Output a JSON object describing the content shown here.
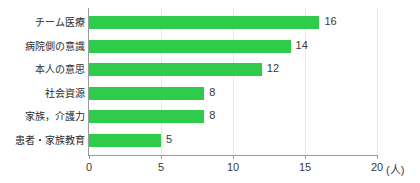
{
  "chart_data": {
    "type": "bar",
    "orientation": "horizontal",
    "title": "",
    "xlabel": "(人)",
    "ylabel": "",
    "xlim": [
      0,
      20
    ],
    "xticks": [
      0,
      5,
      10,
      15,
      20
    ],
    "xtick_labels": [
      "0",
      "5",
      "10",
      "15",
      "20"
    ],
    "grid": true,
    "grid_axis": "x",
    "legend": false,
    "bar_color": "#2ecc4a",
    "axis_color": "#9a9a9a",
    "grid_color": "#e9e9e9",
    "categories": [
      "チーム医療",
      "病院側の意識",
      "本人の意思",
      "社会資源",
      "家族，介護力",
      "患者・家族教育"
    ],
    "values": [
      16,
      14,
      12,
      8,
      8,
      5
    ],
    "value_labels": [
      "16",
      "14",
      "12",
      "8",
      "8",
      "5"
    ]
  }
}
